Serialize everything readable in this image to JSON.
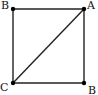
{
  "diagram": {
    "type": "geometry-square-with-diagonal",
    "stroke_color": "#222222",
    "point_color": "#000000",
    "points": [
      {
        "id": "top-left",
        "label": "B",
        "x": 13,
        "y": 9,
        "label_x": 1,
        "label_y": 9
      },
      {
        "id": "top-right",
        "label": "A",
        "x": 84,
        "y": 9,
        "label_x": 87,
        "label_y": 9
      },
      {
        "id": "bottom-left",
        "label": "C",
        "x": 13,
        "y": 83,
        "label_x": 0,
        "label_y": 91
      },
      {
        "id": "bottom-right",
        "label": "B",
        "x": 84,
        "y": 83,
        "label_x": 88,
        "label_y": 94
      }
    ],
    "segments": [
      {
        "from": "top-left",
        "to": "top-right"
      },
      {
        "from": "top-right",
        "to": "bottom-right"
      },
      {
        "from": "bottom-right",
        "to": "bottom-left"
      },
      {
        "from": "bottom-left",
        "to": "top-left"
      },
      {
        "from": "bottom-left",
        "to": "top-right"
      }
    ]
  }
}
